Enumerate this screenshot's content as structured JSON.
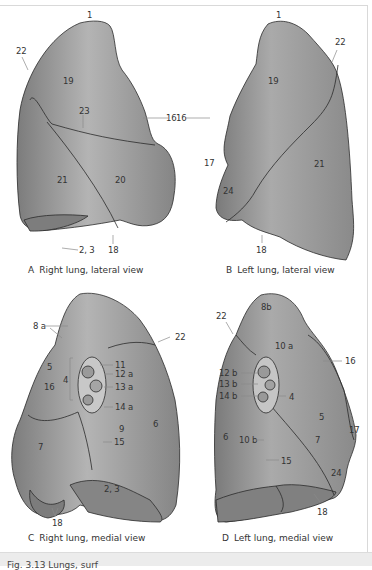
{
  "figure": {
    "caption_strip": "Fig. 3.13 Lungs, surf",
    "colors": {
      "lung_fill": "#8f8f8f",
      "lung_light": "#b7b7b7",
      "lung_dark": "#6e6e6e",
      "outline": "#2b2b2b",
      "leader": "#8a8a8a",
      "label": "#333333"
    }
  },
  "panels": [
    {
      "id": "A",
      "letter": "A",
      "caption": "Right lung, lateral view",
      "labels": {
        "l1": "1",
        "l22": "22",
        "l19": "19",
        "l23": "23",
        "l16": "16",
        "l21": "21",
        "l20": "20",
        "l23b": "2, 3",
        "l18": "18"
      }
    },
    {
      "id": "B",
      "letter": "B",
      "caption": "Left lung, lateral view",
      "labels": {
        "l1": "1",
        "l22": "22",
        "l19": "19",
        "l16": "16",
        "l17": "17",
        "l21": "21",
        "l24": "24",
        "l18": "18"
      }
    },
    {
      "id": "C",
      "letter": "C",
      "caption": "Right lung, medial view",
      "labels": {
        "l8a": "8 a",
        "l22": "22",
        "l5": "5",
        "l4": "4",
        "l16": "16",
        "l11": "11",
        "l12a": "12 a",
        "l13a": "13 a",
        "l14a": "14 a",
        "l9": "9",
        "l6": "6",
        "l15": "15",
        "l7": "7",
        "l23": "2, 3",
        "l18": "18"
      }
    },
    {
      "id": "D",
      "letter": "D",
      "caption": "Left lung, medial view",
      "labels": {
        "l8b": "8b",
        "l22": "22",
        "l10a": "10 a",
        "l16": "16",
        "l12b": "12 b",
        "l13b": "13 b",
        "l14b": "14 b",
        "l4": "4",
        "l5": "5",
        "l17": "17",
        "l6": "6",
        "l10b": "10 b",
        "l7": "7",
        "l15": "15",
        "l24": "24",
        "l18": "18"
      }
    }
  ]
}
